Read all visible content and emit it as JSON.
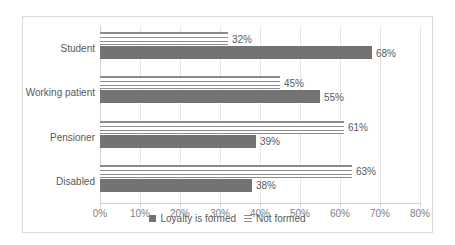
{
  "chart_data": {
    "type": "bar",
    "orientation": "horizontal",
    "title": "",
    "subtitle": "",
    "xlabel": "",
    "ylabel": "",
    "xlim": [
      0,
      80
    ],
    "xunit": "%",
    "grid": true,
    "legend_position": "bottom",
    "categories": [
      "Student",
      "Working patient",
      "Pensioner",
      "Disabled"
    ],
    "series": [
      {
        "name": "Loyalty is formed",
        "style": "solid",
        "color": "#737373",
        "values": [
          68,
          55,
          39,
          38
        ],
        "labels": [
          "68%",
          "55%",
          "39%",
          "38%"
        ]
      },
      {
        "name": "Not formed",
        "style": "horizontal-lines",
        "color": "#8c8c8c",
        "values": [
          32,
          45,
          61,
          63
        ],
        "labels": [
          "32%",
          "45%",
          "61%",
          "63%"
        ]
      }
    ],
    "xticks": [
      0,
      10,
      20,
      30,
      40,
      50,
      60,
      70,
      80
    ],
    "xtick_labels": [
      "0%",
      "10%",
      "20%",
      "30%",
      "40%",
      "50%",
      "60%",
      "70%",
      "80%"
    ]
  },
  "legend": {
    "entries": [
      {
        "label": "Loyalty is formed"
      },
      {
        "label": "Not formed"
      }
    ]
  },
  "colors": {
    "series_solid": "#737373",
    "series_striped": "#8c8c8c",
    "gridline": "#e6e6e6",
    "border": "#d9d9d9",
    "text": "#595959",
    "axis_text": "#808080"
  }
}
